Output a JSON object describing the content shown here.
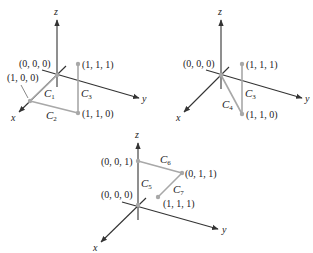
{
  "colors": {
    "axis": "#333333",
    "curve": "#a8a8a8",
    "text": "#222222",
    "background": "#ffffff"
  },
  "diagrams": [
    {
      "id": "diagram-1",
      "axes": {
        "x": "x",
        "y": "y",
        "z": "z"
      },
      "points": [
        {
          "label": "(0, 0, 0)"
        },
        {
          "label": "(1, 0, 0)"
        },
        {
          "label": "(1, 1, 0)"
        },
        {
          "label": "(1, 1, 1)"
        }
      ],
      "curves": [
        {
          "name": "C",
          "sub": "1",
          "from": "(0, 0, 0)",
          "to": "(1, 0, 0)"
        },
        {
          "name": "C",
          "sub": "2",
          "from": "(1, 0, 0)",
          "to": "(1, 1, 0)"
        },
        {
          "name": "C",
          "sub": "3",
          "from": "(1, 1, 0)",
          "to": "(1, 1, 1)"
        }
      ]
    },
    {
      "id": "diagram-2",
      "axes": {
        "x": "x",
        "y": "y",
        "z": "z"
      },
      "points": [
        {
          "label": "(0, 0, 0)"
        },
        {
          "label": "(1, 1, 0)"
        },
        {
          "label": "(1, 1, 1)"
        }
      ],
      "curves": [
        {
          "name": "C",
          "sub": "4",
          "from": "(0, 0, 0)",
          "to": "(1, 1, 0)"
        },
        {
          "name": "C",
          "sub": "3",
          "from": "(1, 1, 0)",
          "to": "(1, 1, 1)"
        }
      ]
    },
    {
      "id": "diagram-3",
      "axes": {
        "x": "x",
        "y": "y",
        "z": "z"
      },
      "points": [
        {
          "label": "(0, 0, 0)"
        },
        {
          "label": "(0, 0, 1)"
        },
        {
          "label": "(0, 1, 1)"
        },
        {
          "label": "(1, 1, 1)"
        }
      ],
      "curves": [
        {
          "name": "C",
          "sub": "5",
          "from": "(0, 0, 0)",
          "to": "(0, 0, 1)"
        },
        {
          "name": "C",
          "sub": "6",
          "from": "(0, 0, 1)",
          "to": "(0, 1, 1)"
        },
        {
          "name": "C",
          "sub": "7",
          "from": "(0, 1, 1)",
          "to": "(1, 1, 1)"
        }
      ]
    }
  ]
}
